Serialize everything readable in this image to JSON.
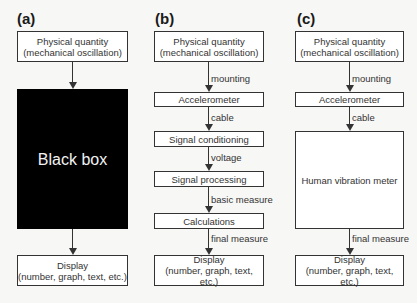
{
  "panels": [
    {
      "label": "(a)",
      "boxes": {
        "input": [
          "Physical quantity",
          "(mechanical oscillation)"
        ],
        "blackbox": "Black box",
        "display": [
          "Display",
          "(number, graph, text, etc.)"
        ]
      }
    },
    {
      "label": "(b)",
      "boxes": {
        "input": [
          "Physical quantity",
          "(mechanical oscillation)"
        ],
        "accelerometer": "Accelerometer",
        "conditioning": "Signal conditioning",
        "processing": "Signal processing",
        "calculations": "Calculations",
        "display": [
          "Display",
          "(number, graph, text, etc.)"
        ]
      },
      "edges": {
        "mounting": "mounting",
        "cable": "cable",
        "voltage": "voltage",
        "basic": "basic measure",
        "final": "final measure"
      }
    },
    {
      "label": "(c)",
      "boxes": {
        "input": [
          "Physical quantity",
          "(mechanical oscillation)"
        ],
        "accelerometer": "Accelerometer",
        "meter": "Human vibration meter",
        "display": [
          "Display",
          "(number, graph, text, etc.)"
        ]
      },
      "edges": {
        "mounting": "mounting",
        "cable": "cable",
        "final": "final measure"
      }
    }
  ]
}
